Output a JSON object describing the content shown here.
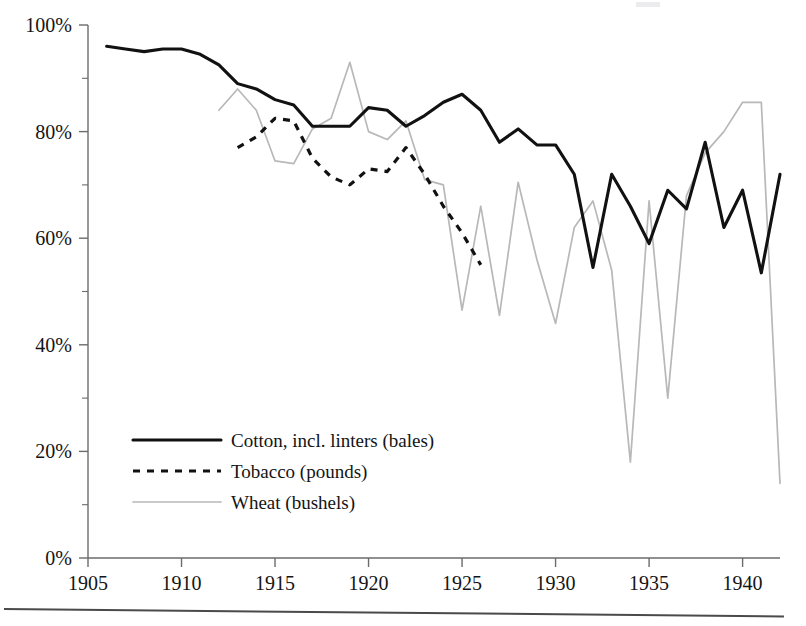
{
  "chart_data": {
    "type": "line",
    "title": "",
    "xlabel": "",
    "ylabel": "",
    "xlim": [
      1905,
      1942
    ],
    "ylim": [
      0,
      100
    ],
    "y_tick_labels": [
      "0%",
      "20%",
      "40%",
      "60%",
      "80%",
      "100%"
    ],
    "y_ticks": [
      0,
      20,
      40,
      60,
      80,
      100
    ],
    "y_minor_ticks": [
      10,
      30,
      50,
      70,
      90
    ],
    "x_tick_labels": [
      "1905",
      "1910",
      "1915",
      "1920",
      "1925",
      "1930",
      "1935",
      "1940"
    ],
    "x_ticks": [
      1905,
      1910,
      1915,
      1920,
      1925,
      1930,
      1935,
      1940
    ],
    "grid": false,
    "legend_position": "lower-left",
    "series": [
      {
        "name": "Cotton, incl. linters (bales)",
        "style": "solid",
        "color": "#111111",
        "x": [
          1906,
          1907,
          1908,
          1909,
          1910,
          1911,
          1912,
          1913,
          1914,
          1915,
          1916,
          1917,
          1918,
          1919,
          1920,
          1921,
          1922,
          1923,
          1924,
          1925,
          1926,
          1927,
          1928,
          1929,
          1930,
          1931,
          1932,
          1933,
          1934,
          1935,
          1936,
          1937,
          1938,
          1939,
          1940,
          1941,
          1942
        ],
        "values": [
          96,
          95.5,
          95,
          95.5,
          95.5,
          94.5,
          92.5,
          89,
          88,
          86,
          85,
          81,
          81,
          81,
          84.5,
          84,
          81,
          83,
          85.5,
          87,
          84,
          78,
          80.5,
          77.5,
          77.5,
          72,
          54.5,
          72,
          66,
          59,
          69,
          65.5,
          78,
          62,
          69,
          53.5,
          72
        ]
      },
      {
        "name": "Tobacco (pounds)",
        "style": "dotted",
        "color": "#111111",
        "x": [
          1913,
          1914,
          1915,
          1916,
          1917,
          1918,
          1919,
          1920,
          1921,
          1922,
          1923,
          1924,
          1925,
          1926
        ],
        "values": [
          77,
          79,
          82.5,
          82,
          75,
          71.5,
          70,
          73,
          72.5,
          77,
          72,
          66,
          61,
          55
        ]
      },
      {
        "name": "Wheat (bushels)",
        "style": "thin-solid",
        "color": "#b8b8b8",
        "x": [
          1912,
          1913,
          1914,
          1915,
          1916,
          1917,
          1918,
          1919,
          1920,
          1921,
          1922,
          1923,
          1924,
          1925,
          1926,
          1927,
          1928,
          1929,
          1930,
          1931,
          1932,
          1933,
          1934,
          1935,
          1936,
          1937,
          1938,
          1939,
          1940,
          1941,
          1942
        ],
        "values": [
          84,
          88,
          84,
          74.5,
          74,
          80.5,
          82.5,
          93,
          80,
          78.5,
          82,
          71,
          70,
          46.5,
          66,
          45.5,
          70.5,
          56,
          44,
          62,
          67,
          54,
          18,
          67,
          30,
          68,
          76,
          80,
          85.5,
          85.5,
          14
        ]
      }
    ]
  },
  "legend": {
    "items": [
      {
        "label": "Cotton, incl. linters (bales)",
        "style": "solid"
      },
      {
        "label": "Tobacco (pounds)",
        "style": "dotted"
      },
      {
        "label": "Wheat (bushels)",
        "style": "thin-solid"
      }
    ]
  }
}
